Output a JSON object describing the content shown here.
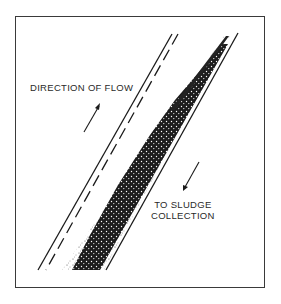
{
  "diagram": {
    "labels": {
      "direction_of_flow": "DIRECTION OF FLOW",
      "to_sludge_line1": "TO SLUDGE",
      "to_sludge_line2": "COLLECTION"
    },
    "elements": {
      "flow_arrow": "arrow-up-right",
      "sludge_arrow": "arrow-down-left",
      "channel": "inclined settling channel with accumulated sludge band"
    },
    "colors": {
      "line": "#1a1a1a",
      "sludge": "#111111",
      "background": "#ffffff"
    }
  }
}
